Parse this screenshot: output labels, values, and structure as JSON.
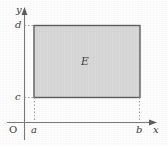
{
  "figure": {
    "background_color": "#fefefe",
    "axes": {
      "x_axis_label": "x",
      "y_axis_label": "y",
      "origin_label": "O",
      "axis_color": "#7a7a7a",
      "arrow_color": "#5e5e5e"
    },
    "ticks": {
      "x": [
        {
          "label": "a",
          "position_px": 34
        },
        {
          "label": "b",
          "position_px": 140
        }
      ],
      "y": [
        {
          "label": "c",
          "position_px": 97
        },
        {
          "label": "d",
          "position_px": 25
        }
      ]
    },
    "region": {
      "label": "E",
      "fill_color": "#d8d8d8",
      "stroke_color": "#5f5f5f",
      "x_from": "a",
      "x_to": "b",
      "y_from": "c",
      "y_to": "d"
    },
    "guides": {
      "style": "dashed",
      "color": "#9a9a9a",
      "lines": [
        "vertical at a from x-axis to c",
        "vertical at b from x-axis to c",
        "horizontal at d from y-axis to region",
        "horizontal at c from y-axis to region"
      ]
    }
  }
}
